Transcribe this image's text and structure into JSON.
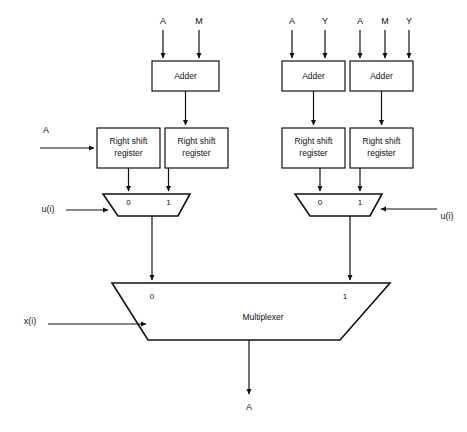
{
  "diagram": {
    "colors": {
      "background": "#ffffff",
      "stroke": "#111111",
      "fill": "#ffffff"
    },
    "adders": [
      {
        "id": "adder-left",
        "label": "Adder",
        "inputs": [
          "A",
          "M"
        ]
      },
      {
        "id": "adder-right-1",
        "label": "Adder",
        "inputs": [
          "A",
          "Y"
        ]
      },
      {
        "id": "adder-right-2",
        "label": "Adder",
        "inputs": [
          "A",
          "M",
          "Y"
        ]
      }
    ],
    "registers": [
      {
        "id": "rsr-1",
        "line1": "Right shift",
        "line2": "register"
      },
      {
        "id": "rsr-2",
        "line1": "Right shift",
        "line2": "register"
      },
      {
        "id": "rsr-3",
        "line1": "Right shift",
        "line2": "register"
      },
      {
        "id": "rsr-4",
        "line1": "Right shift",
        "line2": "register"
      }
    ],
    "small_muxes": [
      {
        "id": "mux-left",
        "sel0": "0",
        "sel1": "1",
        "select_signal": "u(i)",
        "select_side": "left"
      },
      {
        "id": "mux-right",
        "sel0": "0",
        "sel1": "1",
        "select_signal": "u(i)",
        "select_side": "right"
      }
    ],
    "main_mux": {
      "id": "multiplexer-main",
      "label": "Multiplexer",
      "sel0": "0",
      "sel1": "1",
      "select_signal": "x(i)",
      "output": "A"
    },
    "external_inputs": {
      "register_a": "A",
      "adder_left_in_a": "A",
      "adder_left_in_m": "M",
      "adder_right1_in_a": "A",
      "adder_right1_in_y": "Y",
      "adder_right2_in_a": "A",
      "adder_right2_in_m": "M",
      "adder_right2_in_y": "Y",
      "mux_left_select": "u(i)",
      "mux_right_select": "u(i)",
      "main_mux_select": "x(i)"
    },
    "output_label": "A"
  }
}
